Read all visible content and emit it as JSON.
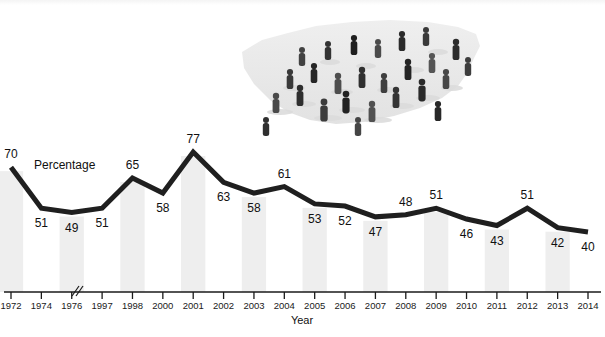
{
  "chart_data": {
    "type": "line",
    "title": "",
    "xlabel": "Year",
    "ylabel": "",
    "series_name": "Percentage",
    "categories": [
      "1972",
      "1974",
      "1976",
      "1997",
      "1998",
      "2000",
      "2001",
      "2002",
      "2003",
      "2004",
      "2005",
      "2006",
      "2007",
      "2008",
      "2009",
      "2010",
      "2011",
      "2012",
      "2013",
      "2014"
    ],
    "values": [
      70,
      51,
      49,
      51,
      65,
      58,
      77,
      63,
      58,
      61,
      53,
      52,
      47,
      48,
      51,
      46,
      43,
      51,
      42,
      40
    ],
    "data_labels": [
      "70",
      "51",
      "49",
      "51",
      "65",
      "58",
      "77",
      "63",
      "58",
      "61",
      "53",
      "52",
      "47",
      "48",
      "51",
      "46",
      "43",
      "51",
      "42",
      "40"
    ],
    "axis_break_after": "1976",
    "axis_break_symbol": "//",
    "ylim": [
      0,
      100
    ],
    "grid": false,
    "legend": "none",
    "background_bands": true,
    "line_color": "#1f1f1f",
    "band_color": "#eeeeee",
    "axis_color": "#1a1a1a"
  },
  "graphic": {
    "alt_name": "crowd-on-us-map-photo",
    "description": "Photograph of many people standing on a silhouette map of the United States",
    "map_color": "#e9e9e9",
    "figure_color": "#3a3a3a"
  }
}
